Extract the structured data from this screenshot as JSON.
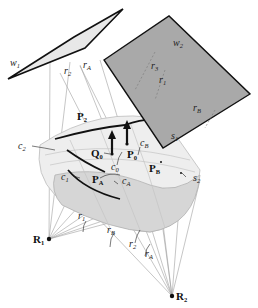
{
  "diagram": {
    "type": "geometric-illustration",
    "planes": [
      {
        "id": "w1",
        "label": "w",
        "subscript": "1",
        "fill": "#e6e6e6"
      },
      {
        "id": "w2",
        "label": "w",
        "subscript": "2",
        "fill": "#a9a9a9"
      }
    ],
    "surfaces": [
      {
        "id": "s1",
        "label": "s",
        "subscript": "1"
      },
      {
        "id": "s2",
        "label": "s",
        "subscript": "2"
      }
    ],
    "curves": [
      {
        "id": "c1",
        "label": "c",
        "subscript": "1"
      },
      {
        "id": "c2",
        "label": "c",
        "subscript": "2"
      },
      {
        "id": "c0",
        "label": "c",
        "subscript": "0"
      },
      {
        "id": "cB",
        "label": "c",
        "subscript": "B"
      },
      {
        "id": "cA",
        "label": "c",
        "subscript": "A"
      }
    ],
    "points": [
      {
        "id": "Q0",
        "label": "Q",
        "subscript": "0"
      },
      {
        "id": "P0",
        "label": "P",
        "subscript": "0"
      },
      {
        "id": "PB",
        "label": "P",
        "subscript": "B"
      },
      {
        "id": "PA",
        "label": "P",
        "subscript": "A"
      },
      {
        "id": "P2",
        "label": "P",
        "subscript": "2"
      },
      {
        "id": "R1",
        "label": "R",
        "subscript": "1"
      },
      {
        "id": "R2",
        "label": "R",
        "subscript": "2"
      }
    ],
    "rays": [
      {
        "id": "r2_top",
        "label": "r",
        "subscript": "2"
      },
      {
        "id": "rA_top",
        "label": "r",
        "subscript": "A"
      },
      {
        "id": "r3_w2",
        "label": "r",
        "subscript": "3"
      },
      {
        "id": "r1_w2",
        "label": "r",
        "subscript": "1"
      },
      {
        "id": "rB_w2",
        "label": "r",
        "subscript": "B"
      },
      {
        "id": "r1_bot",
        "label": "r",
        "subscript": "1"
      },
      {
        "id": "rB_bot",
        "label": "r",
        "subscript": "B"
      },
      {
        "id": "r2_bot",
        "label": "r",
        "subscript": "2"
      },
      {
        "id": "rA_bot",
        "label": "r",
        "subscript": "A"
      }
    ],
    "colors": {
      "plane_light": "#e6e6e6",
      "plane_dark": "#a9a9a9",
      "surface_light": "#eeeeee",
      "surface_mid": "#d4d4d4",
      "line": "#222222",
      "ray": "#9a9a9a"
    }
  }
}
